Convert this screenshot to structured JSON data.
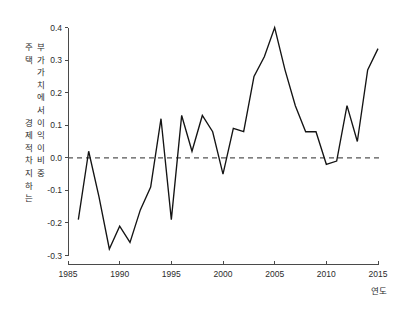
{
  "chart_data": {
    "type": "line",
    "title": "",
    "subtitle": "",
    "xlabel": "연도",
    "ylabel": "주택 부가가치에서 경제적 이익이 차지하는 비중",
    "xlim": [
      1985,
      2015
    ],
    "ylim": [
      -0.3,
      0.4
    ],
    "grid": false,
    "legend": null,
    "xticks": [
      "1985",
      "1990",
      "1995",
      "2000",
      "2005",
      "2010",
      "2015"
    ],
    "xtick_values": [
      1985,
      1990,
      1995,
      2000,
      2005,
      2010,
      2015
    ],
    "yticks": [
      "0.4",
      "0.3",
      "0.2",
      "0.1",
      "0.0",
      "-0.1",
      "-0.2",
      "-0.3"
    ],
    "ytick_values": [
      0.4,
      0.3,
      0.2,
      0.1,
      0.0,
      -0.1,
      -0.2,
      -0.3
    ],
    "annotations": [
      {
        "name": "zero-reference-line",
        "type": "hline",
        "value": 0.0,
        "style": "dashed"
      }
    ],
    "line_color": "#141414",
    "x": [
      1986,
      1987,
      1988,
      1989,
      1990,
      1991,
      1992,
      1993,
      1994,
      1995,
      1996,
      1997,
      1998,
      1999,
      2000,
      2001,
      2002,
      2003,
      2004,
      2005,
      2006,
      2007,
      2008,
      2009,
      2010,
      2011,
      2012,
      2013,
      2014,
      2015
    ],
    "values": [
      -0.19,
      0.02,
      -0.12,
      -0.28,
      -0.21,
      -0.26,
      -0.16,
      -0.09,
      0.12,
      -0.19,
      0.13,
      0.02,
      0.13,
      0.08,
      -0.05,
      0.09,
      0.08,
      0.25,
      0.31,
      0.4,
      0.27,
      0.16,
      0.08,
      0.08,
      -0.02,
      -0.01,
      0.16,
      0.05,
      0.27,
      0.335
    ],
    "series": [
      {
        "name": "주택 부가가치에서 경제적 이익이 차지하는 비중",
        "values": [
          -0.19,
          0.02,
          -0.12,
          -0.28,
          -0.21,
          -0.26,
          -0.16,
          -0.09,
          0.12,
          -0.19,
          0.13,
          0.02,
          0.13,
          0.08,
          -0.05,
          0.09,
          0.08,
          0.25,
          0.31,
          0.4,
          0.27,
          0.16,
          0.08,
          0.08,
          -0.02,
          -0.01,
          0.16,
          0.05,
          0.27,
          0.335
        ]
      }
    ]
  },
  "ylabel_chars": [
    "주",
    "택",
    "부",
    "가",
    "가",
    "치",
    "에",
    "서",
    "경",
    "제",
    "적",
    "이",
    "익",
    "이",
    "차",
    "지",
    "하",
    "는",
    "비",
    "중"
  ]
}
